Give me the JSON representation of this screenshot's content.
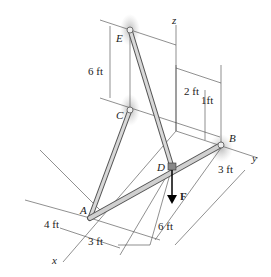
{
  "diagram": {
    "points": {
      "A": {
        "label": "A"
      },
      "B": {
        "label": "B"
      },
      "C": {
        "label": "C"
      },
      "D": {
        "label": "D"
      },
      "E": {
        "label": "E"
      }
    },
    "axes": {
      "x": "x",
      "y": "y",
      "z": "z"
    },
    "force": {
      "label": "F"
    },
    "dimensions": {
      "ce_height": "6 ft",
      "z_to_d": "2 ft",
      "d_to_b": "1ft",
      "b_offset": "3 ft",
      "a_left": "4 ft",
      "a_right": "3 ft",
      "ad_length": "6 ft"
    },
    "colors": {
      "member": "#c8c8c8",
      "member_edge": "#555555",
      "support_shadow": "#b8b8b8",
      "line": "#333333"
    }
  }
}
